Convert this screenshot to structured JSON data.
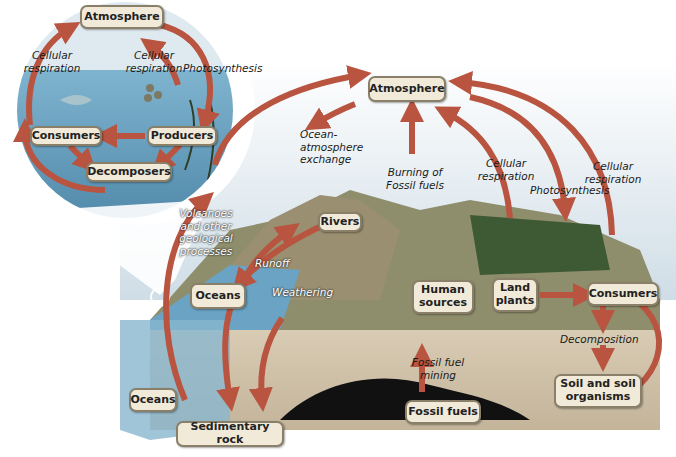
{
  "diagram": {
    "type": "carbon-cycle",
    "colors": {
      "arrow": "#b8543f",
      "box_fill": "#f1ead9",
      "box_border": "#8a7f68",
      "water": "#6aa3c4",
      "sky": "#d9e6ee",
      "land": "#8b8a6a",
      "ground": "#cdbfa8",
      "fossil": "#111111"
    },
    "inset": {
      "boxes": {
        "atmosphere": "Atmosphere",
        "consumers": "Consumers",
        "producers": "Producers",
        "decomposers": "Decomposers"
      },
      "labels": {
        "cellular_respiration_left": "Cellular respiration",
        "cellular_respiration_right": "Cellular respiration",
        "photosynthesis": "Photosynthesis"
      }
    },
    "main": {
      "boxes": {
        "atmosphere": "Atmosphere",
        "rivers": "Rivers",
        "oceans_upper": "Oceans",
        "oceans_lower": "Oceans",
        "human_sources": "Human sources",
        "land_plants": "Land plants",
        "consumers": "Consumers",
        "soil": "Soil and soil organisms",
        "fossil_fuels": "Fossil fuels",
        "sedimentary_rock": "Sedimentary rock"
      },
      "labels": {
        "ocean_atmosphere_exchange": "Ocean-atmosphere exchange",
        "burning_fossil_fuels": "Burning of Fossil fuels",
        "cellular_respiration_1": "Cellular respiration",
        "cellular_respiration_2": "Cellular respiration",
        "photosynthesis": "Photosynthesis",
        "volcanoes": "Volcanoes and other geological processes",
        "runoff": "Runoff",
        "weathering": "Weathering",
        "fossil_fuel_mining": "Fossil fuel mining",
        "decomposition": "Decomposition"
      }
    }
  }
}
